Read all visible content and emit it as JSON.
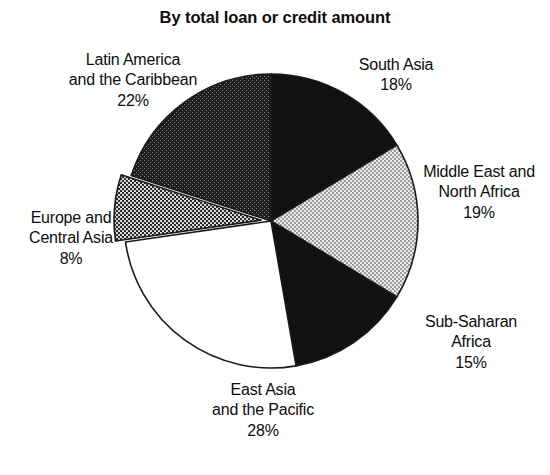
{
  "chart_data": {
    "type": "pie",
    "title": "By total loan or credit amount",
    "xlabel": "",
    "ylabel": "",
    "legend_position": "none",
    "grid": false,
    "categories": [
      "South Asia",
      "Middle East and North Africa",
      "Sub-Saharan Africa",
      "East Asia and the Pacific",
      "Europe and Central Asia",
      "Latin America and the Caribbean"
    ],
    "values": [
      18,
      19,
      15,
      28,
      8,
      22
    ],
    "units": "percent",
    "total": 110,
    "slices": [
      {
        "label": "South Asia",
        "value": 18,
        "value_text": "18%",
        "fill": "solid-black",
        "color": "#111111",
        "exploded": false
      },
      {
        "label": "Middle East and North Africa",
        "value": 19,
        "value_text": "19%",
        "fill": "light-checker",
        "color": "#c9c9c9",
        "exploded": false
      },
      {
        "label": "Sub-Saharan Africa",
        "value": 15,
        "value_text": "15%",
        "fill": "solid-black",
        "color": "#111111",
        "exploded": false
      },
      {
        "label": "East Asia and the Pacific",
        "value": 28,
        "value_text": "28%",
        "fill": "white",
        "color": "#ffffff",
        "exploded": false
      },
      {
        "label": "Europe and Central Asia",
        "value": 8,
        "value_text": "8%",
        "fill": "medium-checker",
        "color": "#6e6e6e",
        "exploded": true
      },
      {
        "label": "Latin America and the Caribbean",
        "value": 22,
        "value_text": "22%",
        "fill": "dark-checker",
        "color": "#3a3a3a",
        "exploded": false
      }
    ]
  },
  "labels": {
    "latin_america": "Latin America\nand the Caribbean\n22%",
    "south_asia": "South Asia\n18%",
    "middle_east": "Middle East and\nNorth Africa\n19%",
    "sub_saharan": "Sub-Saharan\nAfrica\n15%",
    "east_asia": "East Asia\nand the Pacific\n28%",
    "europe": "Europe and\nCentral Asia\n8%"
  },
  "colors": {
    "ink": "#111111",
    "paper": "#ffffff",
    "outline": "#1a1a1a"
  }
}
